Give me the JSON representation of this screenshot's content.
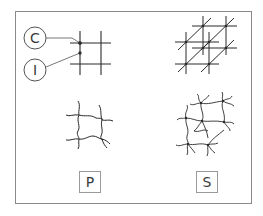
{
  "diagram": {
    "callouts": [
      {
        "id": "C",
        "label": "C"
      },
      {
        "id": "I",
        "label": "I"
      }
    ],
    "panels": [
      {
        "id": "P",
        "label": "P",
        "description": "2D grid with crosslinks (planar)"
      },
      {
        "id": "S",
        "label": "S",
        "description": "3D lattice (spatial)"
      }
    ],
    "colors": {
      "line": "#2a2a2a",
      "frame": "#8a8a8a",
      "box": "#9a9a9a"
    }
  }
}
